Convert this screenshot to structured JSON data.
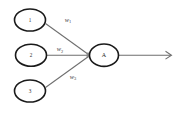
{
  "diagram": {
    "type": "neural-network-perceptron",
    "background_color": "#ffffff",
    "node_stroke_color": "#1a1a1a",
    "edge_color": "#6e6e6e",
    "text_color": "#2b2b2b",
    "input_nodes": [
      {
        "label": "1",
        "name": "input-node-1"
      },
      {
        "label": "2",
        "name": "input-node-2"
      },
      {
        "label": "3",
        "name": "input-node-3"
      }
    ],
    "weights": [
      {
        "symbol": "w",
        "subscript": "1"
      },
      {
        "symbol": "w",
        "subscript": "2"
      },
      {
        "symbol": "w",
        "subscript": "3"
      }
    ],
    "summation_node": {
      "label": "A"
    },
    "output": {
      "label": ""
    }
  }
}
